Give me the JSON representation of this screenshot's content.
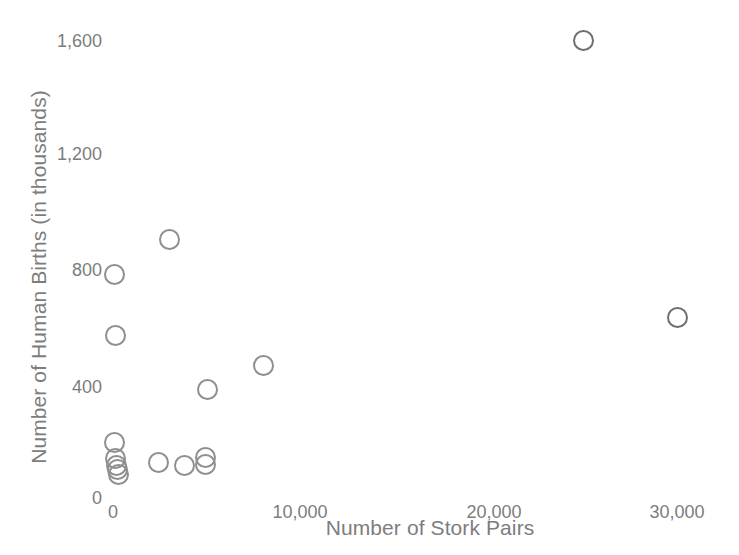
{
  "chart_data": {
    "type": "scatter",
    "title": "",
    "xlabel": "Number of Stork Pairs",
    "ylabel": "Number of Human Births (in thousands)",
    "xlim": [
      0,
      32000
    ],
    "ylim": [
      0,
      1700
    ],
    "xticks": [
      "0",
      "10,000",
      "20,000",
      "30,000"
    ],
    "xtick_values": [
      0,
      10000,
      20000,
      30000
    ],
    "yticks": [
      "0",
      "400",
      "800",
      "1,200",
      "1,600"
    ],
    "ytick_values": [
      0,
      400,
      800,
      1200,
      1600
    ],
    "grid": false,
    "legend": null,
    "marker": "open-circle",
    "marker_color": "#8f8f8f",
    "points": [
      {
        "x": 25000,
        "y": 1600
      },
      {
        "x": 30000,
        "y": 630
      },
      {
        "x": 3000,
        "y": 900
      },
      {
        "x": 100,
        "y": 780
      },
      {
        "x": 150,
        "y": 565
      },
      {
        "x": 8000,
        "y": 460
      },
      {
        "x": 5000,
        "y": 375
      },
      {
        "x": 100,
        "y": 190
      },
      {
        "x": 150,
        "y": 135
      },
      {
        "x": 200,
        "y": 110
      },
      {
        "x": 250,
        "y": 95
      },
      {
        "x": 300,
        "y": 80
      },
      {
        "x": 2400,
        "y": 120
      },
      {
        "x": 3800,
        "y": 110
      },
      {
        "x": 4900,
        "y": 140
      },
      {
        "x": 4900,
        "y": 115
      }
    ]
  },
  "axes": {
    "y_title": "Number of Human Births (in thousands)",
    "x_title": "Number of Stork Pairs",
    "y_tick_labels": [
      "1,600",
      "1,200",
      "800",
      "400",
      "0"
    ],
    "x_tick_labels": [
      "0",
      "10,000",
      "20,000",
      "30,000"
    ]
  },
  "style": {
    "text_color": "#7d7d7d",
    "marker_color": "#8f8f8f",
    "background": "#ffffff"
  }
}
